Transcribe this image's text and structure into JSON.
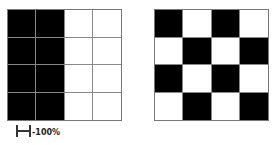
{
  "grids": [
    {
      "name": "left-grid",
      "pattern": "half-split",
      "cells": [
        [
          "b",
          "b",
          "w",
          "w"
        ],
        [
          "b",
          "b",
          "w",
          "w"
        ],
        [
          "b",
          "b",
          "w",
          "w"
        ],
        [
          "b",
          "b",
          "w",
          "w"
        ]
      ]
    },
    {
      "name": "right-grid",
      "pattern": "checkerboard",
      "cells": [
        [
          "b",
          "w",
          "b",
          "w"
        ],
        [
          "w",
          "b",
          "w",
          "b"
        ],
        [
          "b",
          "w",
          "b",
          "w"
        ],
        [
          "w",
          "b",
          "w",
          "b"
        ]
      ]
    }
  ],
  "scale": {
    "icon": "scale-bar-icon",
    "label": "-100%"
  },
  "colors": {
    "black": "#000000",
    "white": "#ffffff",
    "gridline": "#888888"
  }
}
